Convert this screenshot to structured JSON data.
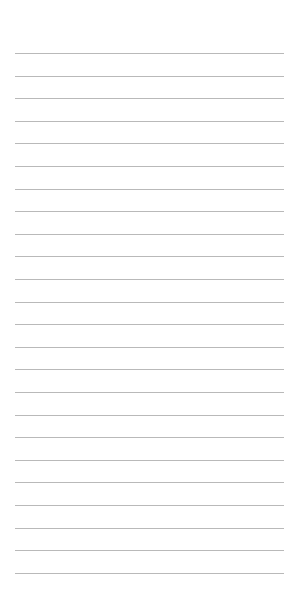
{
  "page": {
    "type": "lined-notepad-page",
    "background_color": "#ffffff",
    "line_color": "#b9b9b9",
    "line_count": 24,
    "first_line_y": 53,
    "line_spacing": 22.6,
    "line_left": 15,
    "line_width": 269,
    "text": ""
  }
}
